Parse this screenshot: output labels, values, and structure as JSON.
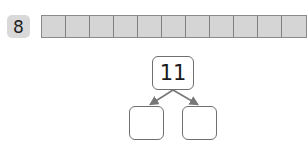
{
  "problem": {
    "number": "8",
    "strip": {
      "cell_count": 11,
      "cell_color": "#d5d5d5"
    },
    "number_bond": {
      "whole": "11",
      "parts": [
        "",
        ""
      ]
    }
  }
}
